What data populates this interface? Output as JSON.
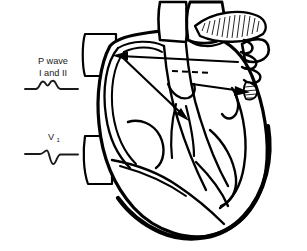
{
  "figure": {
    "background_color": "#ffffff",
    "line_color": "#000000",
    "shade_color": "#e9e9e9",
    "width": 307,
    "height": 251
  },
  "ecg_panel": {
    "traces": [
      {
        "id": "p-wave-lead-i-ii",
        "label_line1": "P wave",
        "label_line2": "I and II",
        "morphology": "notched upright bump",
        "deflection": "positive",
        "label_x": 53,
        "label_y1": 64,
        "label_y2": 76
      },
      {
        "id": "p-wave-lead-v1",
        "label_main": "V",
        "label_subscript": "1",
        "morphology": "biphasic, terminal negative deflection",
        "deflection": "biphasic",
        "label_x": 53,
        "label_y": 140
      }
    ]
  },
  "heart_diagram": {
    "view": "coronal cross-section, cut-away",
    "structures": [
      {
        "name": "aorta",
        "side": "center"
      },
      {
        "name": "pulmonary-artery",
        "side": "center-left"
      },
      {
        "name": "superior-vena-cava",
        "side": "right"
      },
      {
        "name": "left-atrial-appendage",
        "side": "left"
      },
      {
        "name": "right-atrial-appendage",
        "side": "right",
        "texture": "hatched"
      },
      {
        "name": "left-atrium",
        "side": "left"
      },
      {
        "name": "right-atrium",
        "side": "right"
      },
      {
        "name": "left-ventricle",
        "side": "left"
      },
      {
        "name": "right-ventricle",
        "side": "right"
      },
      {
        "name": "interventricular-septum",
        "side": "center"
      },
      {
        "name": "papillary-muscle",
        "side": "left"
      },
      {
        "name": "sinoatrial-node",
        "side": "right"
      }
    ],
    "conduction": {
      "origin": "sinoatrial node",
      "pathways": [
        {
          "id": "left-atrial-spread",
          "direction": "down-and-left",
          "target": "left atrium"
        },
        {
          "id": "right-atrial-spread",
          "direction": "right",
          "target": "right atrium"
        },
        {
          "id": "bachmann-bundle",
          "direction": "left",
          "style": "dashed",
          "target": "interatrial septum"
        }
      ]
    }
  }
}
